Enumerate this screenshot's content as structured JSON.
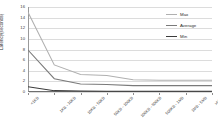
{
  "chart_data": {
    "type": "line",
    "title": "",
    "xlabel": "",
    "ylabel": "Latency(seconds)",
    "ylim": [
      0,
      16
    ],
    "yticks": [
      16,
      14,
      12,
      10,
      8,
      6,
      4,
      2,
      0
    ],
    "grid": true,
    "legend_position": "right",
    "categories": [
      "<1KB",
      "1KB - 10KB",
      "10KB - 50KB",
      "50KB - 100KB",
      "100KB - 500KB",
      "500KB - 1MB",
      "1MB - 5MB",
      ">5MB"
    ],
    "series": [
      {
        "name": "Max",
        "color": "#b0b0b0",
        "values": [
          15.0,
          5.1,
          3.3,
          3.1,
          2.3,
          2.2,
          2.2,
          2.2
        ]
      },
      {
        "name": "Average",
        "color": "#7a7a7a",
        "values": [
          7.9,
          2.5,
          1.5,
          1.4,
          1.2,
          1.2,
          1.2,
          1.2
        ]
      },
      {
        "name": "Min",
        "color": "#3c3c3c",
        "values": [
          1.0,
          0.25,
          0.18,
          0.15,
          0.14,
          0.14,
          0.13,
          0.13
        ]
      }
    ]
  },
  "legend": {
    "entries": [
      {
        "label": "Max",
        "color": "#b0b0b0"
      },
      {
        "label": "Average",
        "color": "#7a7a7a"
      },
      {
        "label": "Min",
        "color": "#3c3c3c"
      }
    ]
  }
}
